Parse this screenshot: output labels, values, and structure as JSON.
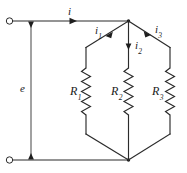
{
  "figure": {
    "type": "electrical-circuit-schematic",
    "line_color": "#2b2b2b",
    "background_color": "#ffffff"
  },
  "labels": {
    "source_voltage": "e",
    "total_current": "i",
    "branch_current_1": {
      "base": "i",
      "sub": "1"
    },
    "branch_current_2": {
      "base": "i",
      "sub": "2"
    },
    "branch_current_3": {
      "base": "i",
      "sub": "3"
    },
    "resistor_1": {
      "base": "R",
      "sub": "1"
    },
    "resistor_2": {
      "base": "R",
      "sub": "2"
    },
    "resistor_3": {
      "base": "R",
      "sub": "3"
    }
  },
  "components": {
    "terminals": [
      {
        "name": "top-terminal",
        "x": 9,
        "y": 21
      },
      {
        "name": "bottom-terminal",
        "x": 9,
        "y": 160
      }
    ],
    "junctions": [
      {
        "name": "top-junction",
        "x": 128,
        "y": 21
      },
      {
        "name": "bottom-junction",
        "x": 128,
        "y": 160
      }
    ],
    "branches": [
      {
        "name": "branch-1",
        "x": 86,
        "resistor": "R1",
        "current": "i1"
      },
      {
        "name": "branch-2",
        "x": 128,
        "resistor": "R2",
        "current": "i2"
      },
      {
        "name": "branch-3",
        "x": 170,
        "resistor": "R3",
        "current": "i3"
      }
    ]
  }
}
